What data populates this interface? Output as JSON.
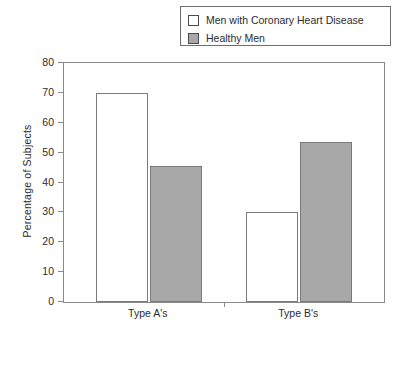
{
  "chart_data": {
    "type": "bar",
    "title": "",
    "xlabel": "",
    "ylabel": "Percentage of Subjects",
    "categories": [
      "Type A's",
      "Type B's"
    ],
    "series": [
      {
        "name": "Men with Coronary Heart Disease",
        "color": "#ffffff",
        "values": [
          70,
          30
        ]
      },
      {
        "name": "Healthy Men",
        "color": "#a8a8a8",
        "values": [
          45.5,
          53.5
        ]
      }
    ],
    "ylim": [
      0,
      80
    ],
    "yticks": [
      0,
      10,
      20,
      30,
      40,
      50,
      60,
      70,
      80
    ],
    "ytick_labels": [
      "0",
      "10",
      "20",
      "30",
      "40",
      "50",
      "60",
      "70",
      "80"
    ],
    "grid": false,
    "legend_position": "top-right"
  },
  "legend": {
    "items": [
      {
        "label": "Men with Coronary Heart Disease",
        "swatch": "white-square-swatch"
      },
      {
        "label": "Healthy Men",
        "swatch": "gray-square-swatch"
      }
    ]
  },
  "axes": {
    "y_title": "Percentage of Subjects",
    "y_max": 80,
    "y_min": 0
  },
  "colors": {
    "bar_white": "#ffffff",
    "bar_gray": "#a8a8a8",
    "frame": "#8a8a8a",
    "text": "#2b2b2b"
  }
}
